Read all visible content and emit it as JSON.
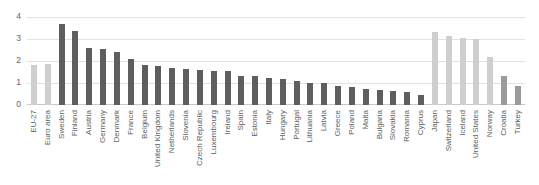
{
  "chart_data": {
    "type": "bar",
    "title": "",
    "xlabel": "",
    "ylabel": "",
    "ylim": [
      0,
      4
    ],
    "yticks": [
      0,
      1,
      2,
      3,
      4
    ],
    "grid": true,
    "legend": "none",
    "categories": [
      "EU-27",
      "Euro area",
      "Sweden",
      "Finland",
      "Austria",
      "Germany",
      "Denmark",
      "France",
      "Belgium",
      "United Kingdom",
      "Netherlands",
      "Slovenia",
      "Czech Republic",
      "Luxembourg",
      "Ireland",
      "Spain",
      "Estonia",
      "Italy",
      "Hungary",
      "Portugal",
      "Lithuania",
      "Latvia",
      "Greece",
      "Poland",
      "Malta",
      "Bulgaria",
      "Slovakia",
      "Romania",
      "Cyprus",
      "Japan",
      "Switzerland",
      "Iceland",
      "United States",
      "Norway",
      "Croatia",
      "Turkey"
    ],
    "values": [
      1.83,
      1.87,
      3.7,
      3.38,
      2.57,
      2.53,
      2.43,
      2.08,
      1.84,
      1.79,
      1.68,
      1.62,
      1.61,
      1.56,
      1.53,
      1.33,
      1.3,
      1.25,
      1.18,
      1.1,
      1.02,
      0.98,
      0.85,
      0.82,
      0.75,
      0.7,
      0.65,
      0.58,
      0.45,
      3.3,
      3.14,
      3.06,
      2.99,
      2.18,
      1.32,
      0.85
    ],
    "series_colors": [
      "light",
      "light",
      "dark",
      "dark",
      "dark",
      "dark",
      "dark",
      "dark",
      "dark",
      "dark",
      "dark",
      "dark",
      "dark",
      "dark",
      "dark",
      "dark",
      "dark",
      "dark",
      "dark",
      "dark",
      "dark",
      "dark",
      "dark",
      "dark",
      "dark",
      "dark",
      "dark",
      "dark",
      "dark",
      "light",
      "light",
      "light",
      "light",
      "light",
      "mid",
      "mid"
    ]
  },
  "colors": {
    "dark_bar": "#5e5e5e",
    "light_bar": "#cfcfcf",
    "mid_bar": "#9b9b9b",
    "gridline": "#e2e2e2",
    "axis_text": "#63676b",
    "background": "#ffffff"
  }
}
